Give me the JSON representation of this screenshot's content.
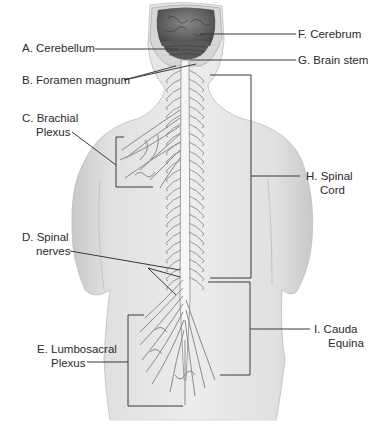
{
  "diagram": {
    "labels": {
      "A": {
        "lines": [
          "A. Cerebellum"
        ]
      },
      "B": {
        "lines": [
          "B. Foramen magnum"
        ]
      },
      "C": {
        "lines": [
          "C. Brachial",
          "Plexus"
        ]
      },
      "D": {
        "lines": [
          "D. Spinal",
          "nerves"
        ]
      },
      "E": {
        "lines": [
          "E. Lumbosacral",
          "Plexus"
        ]
      },
      "F": {
        "lines": [
          "F. Cerebrum"
        ]
      },
      "G": {
        "lines": [
          "G. Brain stem"
        ]
      },
      "H": {
        "lines": [
          "H. Spinal",
          "Cord"
        ]
      },
      "I": {
        "lines": [
          "I. Cauda",
          "Equina"
        ]
      }
    },
    "colors": {
      "skin": "#e2e2e2",
      "skin_shadow": "#c9c9c9",
      "nerve": "#f4f4f4",
      "nerve_outline": "#8a8a8a",
      "brain": "#6e6e6e",
      "leader_line": "#3a3a3a",
      "text": "#2a2a2a"
    }
  }
}
